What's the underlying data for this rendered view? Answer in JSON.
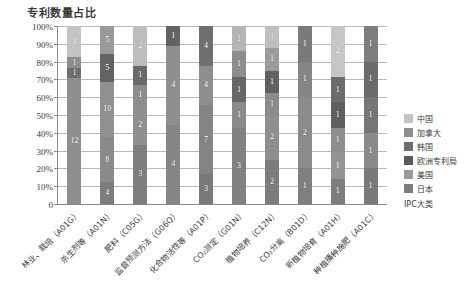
{
  "chart_data": {
    "type": "bar",
    "stacked": true,
    "normalized": true,
    "title": "专利数量占比",
    "xlabel": "IPC大类",
    "ylabel": "",
    "ylim": [
      0,
      100
    ],
    "ytick_labels": [
      "0",
      "10%",
      "20%",
      "30%",
      "40%",
      "50%",
      "60%",
      "70%",
      "80%",
      "90%",
      "100%"
    ],
    "ytick_values": [
      0,
      10,
      20,
      30,
      40,
      50,
      60,
      70,
      80,
      90,
      100
    ],
    "grid": true,
    "legend_position": "right",
    "legend": [
      "中国",
      "加拿大",
      "韩国",
      "欧洲专利局",
      "美国",
      "日本"
    ],
    "colors": {
      "中国": "#c3c3c3",
      "加拿大": "#8e8e8e",
      "韩国": "#6e6e6e",
      "欧洲专利局": "#5a5a5a",
      "美国": "#9a9a9a",
      "日本": "#7d7d7d"
    },
    "categories": [
      "林业、栽培（A01G）",
      "杀生剂等（A01N）",
      "肥料（C05G）",
      "监督预测方法（G06Q）",
      "化合物活性等（A01P）",
      "CO₂测定（G01N）",
      "植物培养（C12N）",
      "CO₂分离（B01D）",
      "新植物培育（A01H）",
      "种植播种施肥（A01C）"
    ],
    "series": [
      {
        "name": "中国",
        "values": [
          3,
          5,
          2,
          0,
          0,
          0,
          1,
          0,
          2,
          0
        ]
      },
      {
        "name": "加拿大",
        "values": [
          1,
          0,
          0,
          0,
          0,
          1,
          1,
          0,
          0,
          1
        ]
      },
      {
        "name": "韩国",
        "values": [
          1,
          5,
          1,
          1,
          0,
          1,
          1,
          1,
          1,
          0
        ]
      },
      {
        "name": "欧洲专利局",
        "values": [
          0,
          0,
          1,
          0,
          4,
          1,
          1,
          0,
          1,
          1
        ]
      },
      {
        "name": "美国",
        "values": [
          12,
          10,
          2,
          4,
          4,
          1,
          2,
          1,
          1,
          1
        ]
      },
      {
        "name": "日本",
        "values": [
          0,
          8,
          3,
          4,
          7,
          3,
          2,
          2,
          1,
          1
        ]
      }
    ],
    "bars": [
      {
        "category": "林业、栽培（A01G）",
        "total": 17,
        "segments": [
          {
            "name": "中国",
            "value": 3,
            "label": "3",
            "color": "#c3c3c3"
          },
          {
            "name": "加拿大",
            "value": 1,
            "label": "1",
            "color": "#8e8e8e"
          },
          {
            "name": "韩国",
            "value": 1,
            "label": "1",
            "color": "#6e6e6e"
          },
          {
            "name": "美国",
            "value": 12,
            "label": "12",
            "color": "#8f8f8f"
          }
        ]
      },
      {
        "category": "杀生剂等（A01N）",
        "total": 28,
        "segments": [
          {
            "name": "中国",
            "value": 5,
            "label": "5",
            "color": "#9a9a9a"
          },
          {
            "name": "韩国",
            "value": 5,
            "label": "5",
            "color": "#636363"
          },
          {
            "name": "美国",
            "value": 10,
            "label": "10",
            "color": "#919191"
          },
          {
            "name": "日本",
            "value": 8,
            "label": "8",
            "color": "#8a8a8a"
          },
          {
            "name": "日本",
            "value": 4,
            "label": "4",
            "color": "#7c7c7c"
          }
        ]
      },
      {
        "category": "肥料（C05G）",
        "total": 9,
        "segments": [
          {
            "name": "中国",
            "value": 2,
            "label": "2",
            "color": "#bdbdbd"
          },
          {
            "name": "韩国",
            "value": 1,
            "label": "1",
            "color": "#6a6a6a"
          },
          {
            "name": "欧洲专利局",
            "value": 1,
            "label": "1",
            "color": "#8c8c8c"
          },
          {
            "name": "美国",
            "value": 2,
            "label": "2",
            "color": "#8f8f8f"
          },
          {
            "name": "日本",
            "value": 3,
            "label": "3",
            "color": "#7e7e7e"
          }
        ]
      },
      {
        "category": "监督预测方法（G06Q）",
        "total": 9,
        "segments": [
          {
            "name": "韩国",
            "value": 1,
            "label": "1",
            "color": "#636363"
          },
          {
            "name": "美国",
            "value": 4,
            "label": "4",
            "color": "#8f8f8f"
          },
          {
            "name": "日本",
            "value": 4,
            "label": "4",
            "color": "#858585"
          }
        ]
      },
      {
        "category": "化合物活性等（A01P）",
        "total": 18,
        "segments": [
          {
            "name": "欧洲专利局",
            "value": 4,
            "label": "4",
            "color": "#6f6f6f"
          },
          {
            "name": "美国",
            "value": 4,
            "label": "4",
            "color": "#8e8e8e"
          },
          {
            "name": "日本",
            "value": 7,
            "label": "7",
            "color": "#848484"
          },
          {
            "name": "日本",
            "value": 3,
            "label": "3",
            "color": "#7a7a7a"
          }
        ]
      },
      {
        "category": "CO₂测定（G01N）",
        "total": 7,
        "segments": [
          {
            "name": "中国",
            "value": 1,
            "label": "1",
            "color": "#b5b5b5"
          },
          {
            "name": "加拿大",
            "value": 1,
            "label": "1",
            "color": "#8d8d8d"
          },
          {
            "name": "韩国",
            "value": 1,
            "label": "1",
            "color": "#676767"
          },
          {
            "name": "欧洲专利局",
            "value": 1,
            "label": "1",
            "color": "#8a8a8a"
          },
          {
            "name": "美国",
            "value": 3,
            "label": "3",
            "color": "#818181"
          }
        ]
      },
      {
        "category": "植物培养（C12N）",
        "total": 8,
        "segments": [
          {
            "name": "中国",
            "value": 1,
            "label": "1",
            "color": "#bfbfbf"
          },
          {
            "name": "加拿大",
            "value": 1,
            "label": "1",
            "color": "#9b9b9b"
          },
          {
            "name": "韩国",
            "value": 1,
            "label": "1",
            "color": "#616161"
          },
          {
            "name": "欧洲专利局",
            "value": 1,
            "label": "1",
            "color": "#8b8b8b"
          },
          {
            "name": "美国",
            "value": 2,
            "label": "2",
            "color": "#8e8e8e"
          },
          {
            "name": "日本",
            "value": 2,
            "label": "2",
            "color": "#7c7c7c"
          }
        ]
      },
      {
        "category": "CO₂分离（B01D）",
        "total": 5,
        "segments": [
          {
            "name": "韩国",
            "value": 1,
            "label": "1",
            "color": "#7a7a7a"
          },
          {
            "name": "欧洲专利局",
            "value": 1,
            "label": "1",
            "color": "#858585"
          },
          {
            "name": "美国",
            "value": 2,
            "label": "2",
            "color": "#8b8b8b"
          },
          {
            "name": "日本",
            "value": 1,
            "label": "1",
            "color": "#7f7f7f"
          }
        ]
      },
      {
        "category": "新植物培育（A01H）",
        "total": 7,
        "segments": [
          {
            "name": "中国",
            "value": 2,
            "label": "2",
            "color": "#c6c6c6"
          },
          {
            "name": "韩国",
            "value": 1,
            "label": "1",
            "color": "#6c6c6c"
          },
          {
            "name": "欧洲专利局",
            "value": 1,
            "label": "1",
            "color": "#5f5f5f"
          },
          {
            "name": "美国",
            "value": 1,
            "label": "1",
            "color": "#8f8f8f"
          },
          {
            "name": "美国",
            "value": 1,
            "label": "1",
            "color": "#949494"
          },
          {
            "name": "日本",
            "value": 1,
            "label": "1",
            "color": "#7d7d7d"
          }
        ]
      },
      {
        "category": "种植播种施肥（A01C）",
        "total": 5,
        "segments": [
          {
            "name": "加拿大",
            "value": 1,
            "label": "1",
            "color": "#7e7e7e"
          },
          {
            "name": "韩国",
            "value": 1,
            "label": "1",
            "color": "#6b6b6b"
          },
          {
            "name": "欧洲专利局",
            "value": 1,
            "label": "1",
            "color": "#767676"
          },
          {
            "name": "美国",
            "value": 1,
            "label": "1",
            "color": "#8a8a8a"
          },
          {
            "name": "日本",
            "value": 1,
            "label": "1",
            "color": "#7a7a7a"
          }
        ]
      }
    ]
  }
}
